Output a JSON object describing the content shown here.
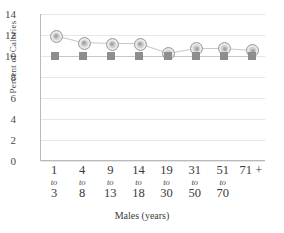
{
  "chart_data": {
    "type": "line",
    "title": "",
    "xlabel": "Males (years)",
    "ylabel": "Percent of Calories",
    "categories": [
      "1 to 3",
      "4 to 8",
      "9 to 13",
      "14 to 18",
      "19 to 30",
      "31 to 50",
      "51 to 70",
      "71 +"
    ],
    "xtick_labels": [
      {
        "num": "1",
        "to": "to",
        "num2": "3"
      },
      {
        "num": "4",
        "to": "to",
        "num2": "8"
      },
      {
        "num": "9",
        "to": "to",
        "num2": "13"
      },
      {
        "num": "14",
        "to": "to",
        "num2": "18"
      },
      {
        "num": "19",
        "to": "to",
        "num2": "30"
      },
      {
        "num": "31",
        "to": "to",
        "num2": "50"
      },
      {
        "num": "51",
        "to": "to",
        "num2": "70"
      },
      {
        "num": "71 +",
        "to": "",
        "num2": ""
      }
    ],
    "ylim": [
      0,
      14
    ],
    "yticks": [
      0,
      2,
      4,
      6,
      8,
      10,
      12,
      14
    ],
    "ytick_labels": [
      "0",
      "2",
      "4",
      "6",
      "8",
      "10",
      "12",
      "14"
    ],
    "grid": true,
    "legend_position": "none",
    "series": [
      {
        "name": "circle-series",
        "marker": "circle",
        "color": "#cfcfcf",
        "values": [
          12.0,
          11.3,
          11.2,
          11.2,
          10.3,
          10.8,
          10.8,
          10.6
        ]
      },
      {
        "name": "square-series",
        "marker": "square",
        "color": "#8e8e8e",
        "values": [
          10.0,
          10.0,
          10.0,
          10.0,
          10.0,
          10.0,
          10.0,
          10.0
        ]
      }
    ]
  }
}
